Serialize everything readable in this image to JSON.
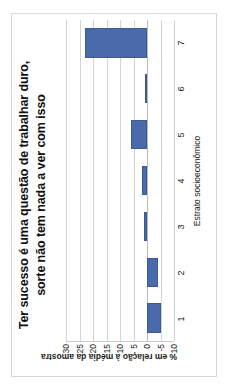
{
  "chart_data": {
    "type": "bar",
    "title": "Ter sucesso é uma questão de trabalhar duro, sorte não tem nada a ver com isso",
    "title_line1": "Ter sucesso é uma questão de trabalhar duro,",
    "title_line2": "sorte não tem nada a ver com isso",
    "xlabel": "Estrato socioeconômico",
    "ylabel": "% em relação à média da amostra",
    "categories": [
      "1",
      "2",
      "3",
      "4",
      "5",
      "6",
      "7"
    ],
    "values": [
      -5,
      -4,
      1,
      2,
      6,
      0.7,
      23
    ],
    "series": [
      {
        "name": "% em relação à média da amostra",
        "values": [
          -5,
          -4,
          1,
          2,
          6,
          0.7,
          23
        ],
        "color": "#4a6aab"
      }
    ],
    "ylim": [
      -10,
      30
    ],
    "yticks": [
      -10,
      -5,
      0,
      5,
      10,
      15,
      20,
      25,
      30
    ],
    "ytick_labels": [
      "-10",
      "-5",
      "0",
      "5",
      "10",
      "15",
      "20",
      "25",
      "30"
    ],
    "grid": true,
    "legend": false,
    "orientation": "rotated-90-ccw",
    "bar_color": "#4a6aab",
    "gridline_color": "#d4d4d4",
    "frame_color": "#d8d8d8"
  }
}
